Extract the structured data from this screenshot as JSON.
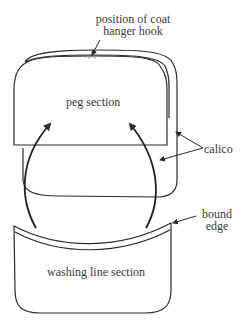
{
  "diagram": {
    "labels": {
      "hook_line1": "position of coat",
      "hook_line2": "hanger hook",
      "peg_section": "peg section",
      "calico": "calico",
      "bound_line1": "bound",
      "bound_line2": "edge",
      "washing_section": "washing line section"
    },
    "colors": {
      "stroke": "#2b2b2b",
      "text": "#3a3a3a",
      "background": "#ffffff"
    }
  }
}
